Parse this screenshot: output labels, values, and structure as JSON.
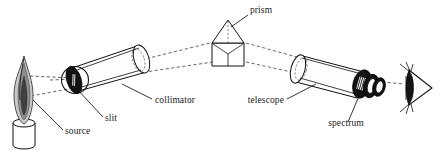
{
  "figure": {
    "background_color": "#ffffff",
    "width": 441,
    "height": 155,
    "line_color": "#111111",
    "ray_color": "#333333"
  },
  "labels": {
    "prism": "prism",
    "collimator": "collimator",
    "telescope": "telescope",
    "slit": "slit",
    "source": "source",
    "spectrum": "spectrum"
  },
  "components": {
    "source": {
      "name": "source",
      "icon": "flame-icon",
      "description": "burner with flame",
      "flame_outer_color": "#c9c9c9",
      "flame_mid_color": "#8d8d8d",
      "flame_core_color": "#3a3a3a",
      "burner_color": "#ffffff"
    },
    "slit": {
      "name": "slit",
      "icon": "slit-icon",
      "description": "dark aperture disc at collimator entrance",
      "color": "#121212"
    },
    "collimator": {
      "name": "collimator",
      "icon": "tube-icon",
      "description": "cylindrical tube with lens at far end"
    },
    "prism": {
      "name": "prism",
      "icon": "prism-icon",
      "description": "triangular dispersing prism"
    },
    "telescope": {
      "name": "telescope",
      "icon": "tube-icon",
      "description": "cylindrical tube with objective lens and eyepiece"
    },
    "spectrum": {
      "name": "spectrum",
      "icon": "spectrum-icon",
      "description": "banded spectrum seen in eyepiece"
    },
    "eye": {
      "name": "eye",
      "icon": "eye-icon",
      "description": "observer eye at right"
    }
  },
  "rays": {
    "count": 6,
    "style": "dashed",
    "description": "light rays from source through slit and collimator to prism, then dispersed to telescope"
  }
}
